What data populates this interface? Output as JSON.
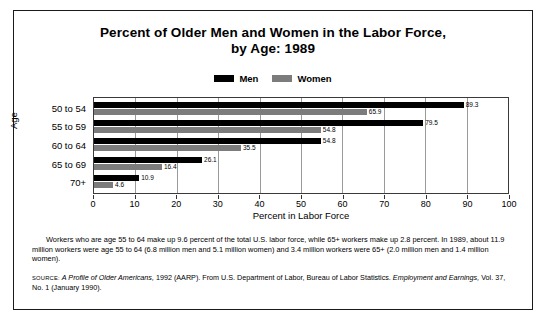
{
  "title": {
    "line1": "Percent of Older Men and Women in the Labor Force,",
    "line2": "by Age: 1989"
  },
  "legend": {
    "items": [
      {
        "label": "Men",
        "color": "#000000"
      },
      {
        "label": "Women",
        "color": "#7c7c7c"
      }
    ]
  },
  "axes": {
    "y_title": "Age",
    "x_title": "Percent in Labor Force",
    "x_ticks": [
      "0",
      "10",
      "20",
      "30",
      "40",
      "50",
      "60",
      "70",
      "80",
      "90",
      "100"
    ]
  },
  "note": {
    "line1": "Workers who are age 55 to 64 make up 9.6 percent of the total U.S. labor force, while 65+ workers make up 2.8 percent.",
    "line2": "In 1989, about 11.9 million workers were age 55 to 64 (6.8 million men and 5.1 million women) and 3.4 million workers were 65+",
    "line3": "(2.0 million men and 1.4 million women)."
  },
  "source": {
    "label": "SOURCE:",
    "part1": "A Profile of Older Americans,",
    "part2": " 1992 (AARP). From U.S. Department of Labor, Bureau of Labor Statistics. ",
    "part3": "Employment and Earnings,",
    "part4": " Vol. 37, No. 1 (January 1990)."
  },
  "chart_data": {
    "type": "bar",
    "orientation": "horizontal",
    "title": "Percent of Older Men and Women in the Labor Force, by Age: 1989",
    "xlabel": "Percent in Labor Force",
    "ylabel": "Age",
    "xlim": [
      0,
      100
    ],
    "xticks": [
      0,
      10,
      20,
      30,
      40,
      50,
      60,
      70,
      80,
      90,
      100
    ],
    "grid": true,
    "legend_position": "top-center",
    "categories": [
      "50 to 54",
      "55 to 59",
      "60 to 64",
      "65 to 69",
      "70+"
    ],
    "series": [
      {
        "name": "Men",
        "color": "#000000",
        "values": [
          89.3,
          79.5,
          54.8,
          26.1,
          10.9
        ]
      },
      {
        "name": "Women",
        "color": "#7c7c7c",
        "values": [
          65.9,
          54.8,
          35.5,
          16.4,
          4.6
        ]
      }
    ]
  }
}
